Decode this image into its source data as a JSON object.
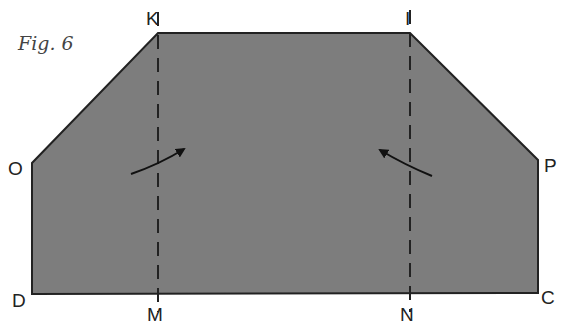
{
  "caption": "Fig. 6",
  "colors": {
    "fill": "#7d7d7d",
    "stroke": "#222222",
    "background": "#ffffff"
  },
  "shape": {
    "type": "octagonal panel (rectangle with clipped top corners)",
    "vertices": [
      "K",
      "I",
      "P",
      "C",
      "D",
      "O"
    ]
  },
  "labels": {
    "K": "K",
    "I": "I",
    "O": "O",
    "P": "P",
    "D": "D",
    "C": "C",
    "M": "M",
    "N": "N"
  },
  "fold_lines": [
    {
      "from": "K",
      "to": "M",
      "style": "dashed"
    },
    {
      "from": "I",
      "to": "N",
      "style": "dashed"
    }
  ],
  "arrows": [
    {
      "name": "left-fold-arrow",
      "direction": "up-right toward fold line KM"
    },
    {
      "name": "right-fold-arrow",
      "direction": "up-left toward fold line IN"
    }
  ]
}
